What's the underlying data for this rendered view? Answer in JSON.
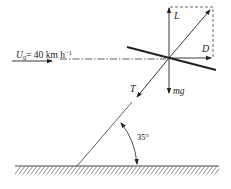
{
  "diagram": {
    "type": "kite force diagram",
    "wind_label": {
      "symbol": "U",
      "subscript": "0",
      "value": "= 40 km h",
      "superscript": "−1"
    },
    "forces": {
      "lift": "L",
      "drag": "D",
      "tension": "T",
      "weight": "mg"
    },
    "angle_label": "35°",
    "colors": {
      "ink": "#222222",
      "background": "#ffffff"
    }
  }
}
